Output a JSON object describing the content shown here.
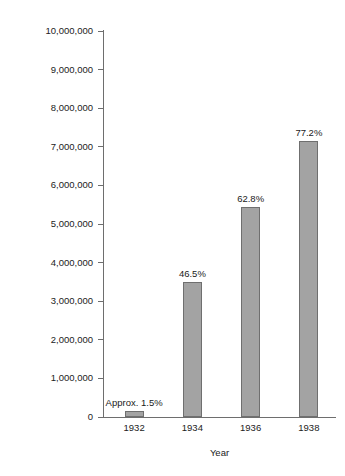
{
  "chart_data": {
    "type": "bar",
    "title": "",
    "xlabel": "Year",
    "ylabel": "Membership",
    "categories": [
      "1932",
      "1934",
      "1936",
      "1938"
    ],
    "values": [
      150000,
      3500000,
      5440000,
      7150000
    ],
    "data_labels": [
      "Approx. 1.5%",
      "46.5%",
      "62.8%",
      "77.2%"
    ],
    "ylim": [
      0,
      10000000
    ],
    "ytick_values": [
      0,
      1000000,
      2000000,
      3000000,
      4000000,
      5000000,
      6000000,
      7000000,
      8000000,
      9000000,
      10000000
    ],
    "ytick_labels": [
      "0",
      "1,000,000",
      "2,000,000",
      "3,000,000",
      "4,000,000",
      "5,000,000",
      "6,000,000",
      "7,000,000",
      "8,000,000",
      "9,000,000",
      "10,000,000"
    ],
    "grid": false,
    "legend": "none",
    "bar_color": "#a3a3a3",
    "bar_border_color": "#6f6f6f",
    "axis_color": "#6e6e6e"
  },
  "axes": {
    "y_title": "Membership",
    "x_title": "Year"
  }
}
